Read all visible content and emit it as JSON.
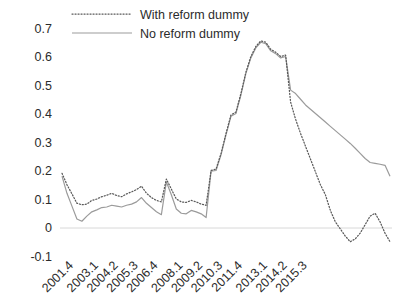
{
  "chart_data": {
    "type": "line",
    "title": "",
    "xlabel": "",
    "ylabel": "",
    "ylim": [
      -0.1,
      0.7
    ],
    "ytick_labels": [
      "0.7",
      "0.6",
      "0.5",
      "0.4",
      "0.3",
      "0.2",
      "0.1",
      "0",
      "-0.1"
    ],
    "ytick_values": [
      0.7,
      0.6,
      0.5,
      0.4,
      0.3,
      0.2,
      0.1,
      0,
      -0.1
    ],
    "grid": false,
    "legend_position": "top-center",
    "axis_line": "zero-baseline only",
    "xtick_labels": [
      "2001.4",
      "2003.1",
      "2004.2",
      "2005.3",
      "2006.4",
      "2008.1",
      "2009.2",
      "2010.3",
      "2011.4",
      "2013.1",
      "2014.2",
      "2015.3"
    ],
    "xtick_indices": [
      0,
      5,
      9,
      13,
      17,
      22,
      26,
      30,
      34,
      39,
      43,
      47
    ],
    "x": [
      "2001.4",
      "2002.1",
      "2002.2",
      "2002.3",
      "2002.4",
      "2003.1",
      "2003.2",
      "2003.3",
      "2003.4",
      "2004.1",
      "2004.2",
      "2004.3",
      "2004.4",
      "2005.1",
      "2005.2",
      "2005.3",
      "2005.4",
      "2006.1",
      "2006.2",
      "2006.3",
      "2006.4",
      "2007.1",
      "2007.2",
      "2007.3",
      "2007.4",
      "2008.1",
      "2008.2",
      "2008.3",
      "2008.4",
      "2009.1",
      "2009.2",
      "2009.3",
      "2009.4",
      "2010.1",
      "2010.2",
      "2010.3",
      "2010.4",
      "2011.1",
      "2011.2",
      "2011.3",
      "2011.4",
      "2012.1",
      "2012.2",
      "2012.3",
      "2012.4",
      "2013.1",
      "2013.2",
      "2013.3",
      "2013.4",
      "2014.1",
      "2014.2",
      "2014.3",
      "2014.4",
      "2015.1",
      "2015.2",
      "2015.3",
      "2015.4"
    ],
    "series": [
      {
        "name": "With reform dummy",
        "style": "dotted",
        "color": "#5a5a5a",
        "values": [
          0.19,
          0.15,
          0.118,
          0.085,
          0.08,
          0.082,
          0.095,
          0.1,
          0.108,
          0.113,
          0.12,
          0.112,
          0.108,
          0.118,
          0.125,
          0.133,
          0.145,
          0.12,
          0.105,
          0.095,
          0.09,
          0.17,
          0.135,
          0.1,
          0.09,
          0.088,
          0.095,
          0.09,
          0.082,
          0.078,
          0.2,
          0.205,
          0.26,
          0.33,
          0.395,
          0.405,
          0.47,
          0.545,
          0.6,
          0.635,
          0.655,
          0.65,
          0.625,
          0.615,
          0.6,
          0.605,
          0.64,
          0.59,
          0.56,
          0.54,
          0.52,
          0.505,
          0.495,
          0.492,
          0.495,
          0.497,
          0.49
        ]
      },
      {
        "name": "No reform dummy",
        "style": "solid",
        "color": "#9b9b9b",
        "values": [
          0.18,
          0.12,
          0.075,
          0.03,
          0.022,
          0.04,
          0.055,
          0.062,
          0.07,
          0.072,
          0.078,
          0.075,
          0.072,
          0.078,
          0.082,
          0.09,
          0.105,
          0.085,
          0.07,
          0.055,
          0.045,
          0.16,
          0.115,
          0.065,
          0.05,
          0.048,
          0.06,
          0.055,
          0.048,
          0.035,
          0.198,
          0.2,
          0.255,
          0.325,
          0.39,
          0.4,
          0.465,
          0.54,
          0.595,
          0.63,
          0.65,
          0.645,
          0.62,
          0.61,
          0.595,
          0.6,
          0.635,
          0.585,
          0.555,
          0.535,
          0.515,
          0.5,
          0.49,
          0.488,
          0.492,
          0.494,
          0.488
        ]
      }
    ],
    "series_tail": {
      "note": "after 2013.1 the two series diverge strongly",
      "with_reform_dummy_tail": [
        0.49,
        0.44,
        0.38,
        0.33,
        0.285,
        0.24,
        0.195,
        0.15,
        0.115,
        0.06,
        0.02,
        -0.005,
        -0.03,
        -0.05,
        -0.04,
        -0.02,
        0.01,
        0.04,
        0.05,
        0.02,
        -0.02,
        -0.05
      ],
      "no_reform_dummy_tail": [
        0.488,
        0.482,
        0.47,
        0.45,
        0.43,
        0.415,
        0.4,
        0.385,
        0.37,
        0.355,
        0.34,
        0.325,
        0.31,
        0.295,
        0.278,
        0.26,
        0.242,
        0.228,
        0.225,
        0.222,
        0.218,
        0.18
      ]
    },
    "annotations": []
  },
  "legend": {
    "items": [
      {
        "label": "With reform dummy",
        "style": "dotted",
        "color": "#5a5a5a"
      },
      {
        "label": "No reform dummy",
        "style": "solid",
        "color": "#9b9b9b"
      }
    ]
  }
}
